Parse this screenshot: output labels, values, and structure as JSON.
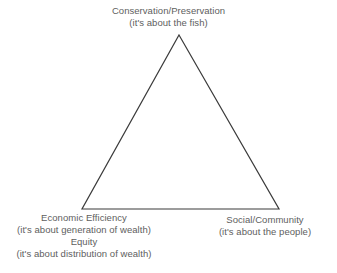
{
  "diagram": {
    "shape": "triangle",
    "line_color": "#3b3b3b",
    "text_color": "#5e5e5e",
    "background_color": "#ffffff",
    "vertices": {
      "apex": {
        "x": 179,
        "y": 35
      },
      "bottom_left": {
        "x": 82,
        "y": 209
      },
      "bottom_right": {
        "x": 279,
        "y": 209
      }
    }
  },
  "labels": {
    "apex": {
      "name": "Conservation/Preservation",
      "subtitle": "(it's about the fish)"
    },
    "bottom_left_primary": {
      "name": "Economic Efficiency",
      "subtitle": "(it's about generation of wealth)"
    },
    "bottom_left_secondary": {
      "name": "Equity",
      "subtitle": "(it's about distribution of wealth)"
    },
    "bottom_right": {
      "name": "Social/Community",
      "subtitle": "(it's about the people)"
    }
  }
}
